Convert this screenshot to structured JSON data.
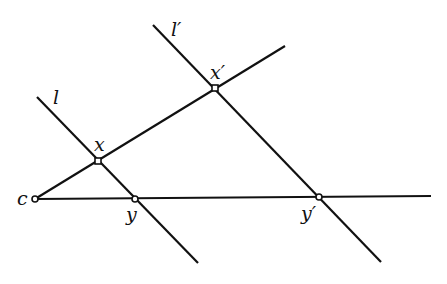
{
  "diagram": {
    "lines": [
      {
        "id": "ray-cx",
        "from": [
          35,
          199
        ],
        "to": [
          285,
          46
        ]
      },
      {
        "id": "ray-cy",
        "from": [
          35,
          199
        ],
        "to": [
          431,
          196
        ]
      },
      {
        "id": "line-l",
        "from": [
          37,
          97
        ],
        "to": [
          198,
          263
        ]
      },
      {
        "id": "line-l-prime",
        "from": [
          153,
          25
        ],
        "to": [
          381,
          262
        ]
      }
    ],
    "points": [
      {
        "id": "c",
        "x": 35,
        "y": 199
      },
      {
        "id": "x",
        "x": 98,
        "y": 161
      },
      {
        "id": "y",
        "x": 135,
        "y": 199
      },
      {
        "id": "x-prime",
        "x": 215,
        "y": 88
      },
      {
        "id": "y-prime",
        "x": 319,
        "y": 197
      }
    ],
    "labels": {
      "c": "c",
      "x": "x",
      "y": "y",
      "x_prime": "x′",
      "y_prime": "y′",
      "l": "l",
      "l_prime": "l′"
    },
    "colors": {
      "stroke": "#111111",
      "background": "#ffffff"
    }
  }
}
